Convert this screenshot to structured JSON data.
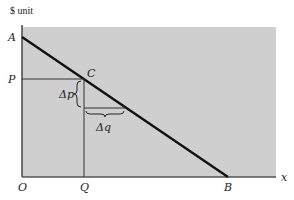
{
  "diagram": {
    "y_axis_label": "$ unit",
    "x_axis_label": "x",
    "points": {
      "A": "A",
      "P": "P",
      "C": "C",
      "O": "O",
      "Q": "Q",
      "B": "B"
    },
    "delta_p": "Δp",
    "delta_q": "Δq",
    "colors": {
      "shade": "#cfcfcf",
      "line": "#111111",
      "axis": "#444444"
    }
  }
}
